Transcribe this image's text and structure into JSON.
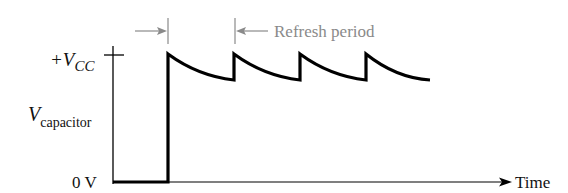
{
  "diagram": {
    "labels": {
      "vcc_main": "+V",
      "vcc_sub": "CC",
      "vcap_main": "V",
      "vcap_sub": "capacitor",
      "zero": "0 V",
      "time": "Time",
      "refresh": "Refresh period"
    },
    "colors": {
      "waveform": "#000000",
      "axis": "#000000",
      "annotation": "#8a8a8a",
      "text": "#111111"
    },
    "waveform": {
      "step_x": 168,
      "baseline_y": 182,
      "peak_y": 54,
      "trough_y": 80,
      "peaks_x": [
        168,
        234,
        300,
        366
      ],
      "end_x": 430
    }
  }
}
